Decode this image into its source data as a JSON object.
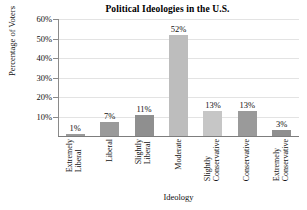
{
  "chart_data": {
    "type": "bar",
    "title": "Political Ideologies in the U.S.",
    "xlabel": "Ideology",
    "ylabel": "Percentage of Voters",
    "categories": [
      "Extremely Liberal",
      "Liberal",
      "Slightly Liberal",
      "Moderate",
      "Slightly Conservative",
      "Conservative",
      "Extremely Conservative"
    ],
    "category_lines": [
      [
        "Extremely",
        "Liberal"
      ],
      [
        "Liberal",
        ""
      ],
      [
        "Slightly",
        "Liberal"
      ],
      [
        "Moderate",
        ""
      ],
      [
        "Slightly",
        "Conservative"
      ],
      [
        "Conservative",
        ""
      ],
      [
        "Extremely",
        "Conservative"
      ]
    ],
    "values": [
      1,
      7,
      11,
      52,
      13,
      13,
      3
    ],
    "value_labels": [
      "1%",
      "7%",
      "11%",
      "52%",
      "13%",
      "13%",
      "3%"
    ],
    "bar_colors": [
      "#9a9a9a",
      "#9a9a9a",
      "#8f8f8f",
      "#bdbdbd",
      "#c6c6c6",
      "#9a9a9a",
      "#8f8f8f"
    ],
    "ylim": [
      0,
      60
    ],
    "ytick_values": [
      10,
      20,
      30,
      40,
      50,
      60
    ],
    "ytick_labels": [
      "10%",
      "20%",
      "30%",
      "40%",
      "50%",
      "60%"
    ],
    "grid": true,
    "grid_color": "#e3e3e3",
    "legend": null,
    "legend_position": "none",
    "axis_color": "#8a8a8a",
    "background": "#ffffff"
  }
}
